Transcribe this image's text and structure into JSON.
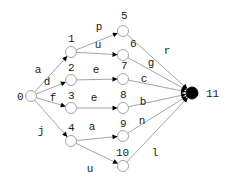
{
  "diagram": {
    "type": "directed-graph",
    "nodes": [
      {
        "id": "0",
        "label": "0",
        "x": 31,
        "y": 96,
        "final": false,
        "label_dx": -14,
        "label_dy": 4
      },
      {
        "id": "1",
        "label": "1",
        "x": 71,
        "y": 52,
        "final": false,
        "label_dx": -3,
        "label_dy": -10
      },
      {
        "id": "2",
        "label": "2",
        "x": 71,
        "y": 80,
        "final": false,
        "label_dx": -3,
        "label_dy": -9
      },
      {
        "id": "3",
        "label": "3",
        "x": 71,
        "y": 108,
        "final": false,
        "label_dx": -3,
        "label_dy": -9
      },
      {
        "id": "4",
        "label": "4",
        "x": 71,
        "y": 141,
        "final": false,
        "label_dx": -3,
        "label_dy": -10
      },
      {
        "id": "5",
        "label": "5",
        "x": 123,
        "y": 31,
        "final": false,
        "label_dx": -2,
        "label_dy": -12
      },
      {
        "id": "6",
        "label": "6",
        "x": 123,
        "y": 55,
        "final": false,
        "label_dx": 7,
        "label_dy": -8
      },
      {
        "id": "7",
        "label": "7",
        "x": 123,
        "y": 79,
        "final": false,
        "label_dx": -2,
        "label_dy": -10
      },
      {
        "id": "8",
        "label": "8",
        "x": 123,
        "y": 108,
        "final": false,
        "label_dx": -3,
        "label_dy": -10
      },
      {
        "id": "9",
        "label": "9",
        "x": 123,
        "y": 136,
        "final": false,
        "label_dx": -3,
        "label_dy": -9
      },
      {
        "id": "10",
        "label": "10",
        "x": 123,
        "y": 166,
        "final": false,
        "label_dx": -7,
        "label_dy": -10
      },
      {
        "id": "11",
        "label": "11",
        "x": 192,
        "y": 93,
        "final": true,
        "label_dx": 14,
        "label_dy": 4
      }
    ],
    "edges": [
      {
        "from": "0",
        "to": "1",
        "label": "a",
        "lx": 38,
        "ly": 73
      },
      {
        "from": "0",
        "to": "2",
        "label": "d",
        "lx": 47,
        "ly": 85
      },
      {
        "from": "0",
        "to": "3",
        "label": "f",
        "lx": 53,
        "ly": 101
      },
      {
        "from": "0",
        "to": "4",
        "label": "j",
        "lx": 41,
        "ly": 134
      },
      {
        "from": "1",
        "to": "5",
        "label": "p",
        "lx": 99,
        "ly": 30
      },
      {
        "from": "1",
        "to": "6",
        "label": "u",
        "lx": 98,
        "ly": 48
      },
      {
        "from": "2",
        "to": "7",
        "label": "e",
        "lx": 96,
        "ly": 73
      },
      {
        "from": "3",
        "to": "8",
        "label": "e",
        "lx": 94,
        "ly": 101
      },
      {
        "from": "4",
        "to": "9",
        "label": "a",
        "lx": 92,
        "ly": 130
      },
      {
        "from": "4",
        "to": "10",
        "label": "u",
        "lx": 90,
        "ly": 172
      },
      {
        "from": "5",
        "to": "11",
        "label": "r",
        "lx": 167,
        "ly": 54
      },
      {
        "from": "6",
        "to": "11",
        "label": "g",
        "lx": 151,
        "ly": 66
      },
      {
        "from": "7",
        "to": "11",
        "label": "c",
        "lx": 144,
        "ly": 82
      },
      {
        "from": "8",
        "to": "11",
        "label": "b",
        "lx": 143,
        "ly": 105
      },
      {
        "from": "9",
        "to": "11",
        "label": "n",
        "lx": 142,
        "ly": 124
      },
      {
        "from": "10",
        "to": "11",
        "label": "l",
        "lx": 155,
        "ly": 156
      }
    ],
    "colors": {
      "edge": "#9a9a9a",
      "node_stroke": "#9a9a9a",
      "final_node": "#000000",
      "arrowhead": "#000000",
      "text": "#222222"
    }
  }
}
